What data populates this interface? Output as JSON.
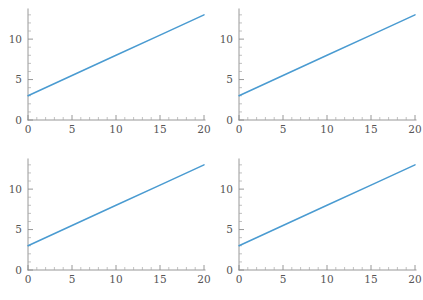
{
  "figure": {
    "title": "",
    "background_color": "#ffffff",
    "layout": "2x2 grid of identical line plots",
    "panel_count": 4,
    "panel_width": 211,
    "panel_height": 150
  },
  "style": {
    "line_color": "#4a9bd1",
    "axis_color": "#8c8c8c",
    "minor_tick_color": "#a8a8a8",
    "tick_label_color": "#555555"
  },
  "axes": {
    "x_major_ticks": [
      "0",
      "5",
      "10",
      "15",
      "20"
    ],
    "x_major_values": [
      0,
      5,
      10,
      15,
      20
    ],
    "y_major_ticks": [
      "0",
      "5",
      "10"
    ],
    "y_major_values": [
      0,
      5,
      10
    ],
    "x_minor_per_interval": 4,
    "y_minor_per_interval": 4,
    "xlim": [
      0,
      20
    ],
    "ylim": [
      0,
      13.6
    ],
    "xlabel": "",
    "ylabel": "",
    "grid": false
  },
  "panels": [
    {
      "id": "panel-top-left",
      "position": "top-left",
      "title": "",
      "xlabel": "",
      "ylabel": ""
    },
    {
      "id": "panel-top-right",
      "position": "top-right",
      "title": "",
      "xlabel": "",
      "ylabel": ""
    },
    {
      "id": "panel-bottom-left",
      "position": "bottom-left",
      "title": "",
      "xlabel": "",
      "ylabel": ""
    },
    {
      "id": "panel-bottom-right",
      "position": "bottom-right",
      "title": "",
      "xlabel": "",
      "ylabel": ""
    }
  ],
  "chart_data": [
    {
      "type": "line",
      "panel": "top-left",
      "title": "",
      "xlabel": "",
      "ylabel": "",
      "xlim": [
        0,
        20
      ],
      "ylim": [
        0,
        13.6
      ],
      "xticks": [
        0,
        5,
        10,
        15,
        20
      ],
      "yticks": [
        0,
        5,
        10
      ],
      "grid": false,
      "legend": null,
      "series": [
        {
          "name": "y = 3 + 0.5x",
          "color": "#4a9bd1",
          "x": [
            0,
            5,
            10,
            15,
            20
          ],
          "values": [
            3,
            5.5,
            8,
            10.5,
            13
          ]
        }
      ]
    },
    {
      "type": "line",
      "panel": "top-right",
      "title": "",
      "xlabel": "",
      "ylabel": "",
      "xlim": [
        0,
        20
      ],
      "ylim": [
        0,
        13.6
      ],
      "xticks": [
        0,
        5,
        10,
        15,
        20
      ],
      "yticks": [
        0,
        5,
        10
      ],
      "grid": false,
      "legend": null,
      "series": [
        {
          "name": "y = 3 + 0.5x",
          "color": "#4a9bd1",
          "x": [
            0,
            5,
            10,
            15,
            20
          ],
          "values": [
            3,
            5.5,
            8,
            10.5,
            13
          ]
        }
      ]
    },
    {
      "type": "line",
      "panel": "bottom-left",
      "title": "",
      "xlabel": "",
      "ylabel": "",
      "xlim": [
        0,
        20
      ],
      "ylim": [
        0,
        13.6
      ],
      "xticks": [
        0,
        5,
        10,
        15,
        20
      ],
      "yticks": [
        0,
        5,
        10
      ],
      "grid": false,
      "legend": null,
      "series": [
        {
          "name": "y = 3 + 0.5x",
          "color": "#4a9bd1",
          "x": [
            0,
            5,
            10,
            15,
            20
          ],
          "values": [
            3,
            5.5,
            8,
            10.5,
            13
          ]
        }
      ]
    },
    {
      "type": "line",
      "panel": "bottom-right",
      "title": "",
      "xlabel": "",
      "ylabel": "",
      "xlim": [
        0,
        20
      ],
      "ylim": [
        0,
        13.6
      ],
      "xticks": [
        0,
        5,
        10,
        15,
        20
      ],
      "yticks": [
        0,
        5,
        10
      ],
      "grid": false,
      "legend": null,
      "series": [
        {
          "name": "y = 3 + 0.5x",
          "color": "#4a9bd1",
          "x": [
            0,
            5,
            10,
            15,
            20
          ],
          "values": [
            3,
            5.5,
            8,
            10.5,
            13
          ]
        }
      ]
    }
  ]
}
